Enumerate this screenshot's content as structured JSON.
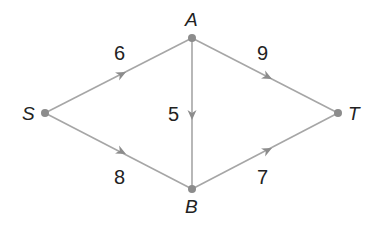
{
  "diagram": {
    "type": "directed-network",
    "edge_color": "#a6a6a6",
    "node_color": "#8c8c8c",
    "nodes": [
      {
        "id": "S",
        "label": "S",
        "x": 45,
        "y": 113
      },
      {
        "id": "A",
        "label": "A",
        "x": 192,
        "y": 38
      },
      {
        "id": "B",
        "label": "B",
        "x": 192,
        "y": 189
      },
      {
        "id": "T",
        "label": "T",
        "x": 338,
        "y": 113
      }
    ],
    "edges": [
      {
        "from": "S",
        "to": "A",
        "weight": "6"
      },
      {
        "from": "S",
        "to": "B",
        "weight": "8"
      },
      {
        "from": "A",
        "to": "B",
        "weight": "5"
      },
      {
        "from": "A",
        "to": "T",
        "weight": "9"
      },
      {
        "from": "B",
        "to": "T",
        "weight": "7"
      }
    ]
  }
}
